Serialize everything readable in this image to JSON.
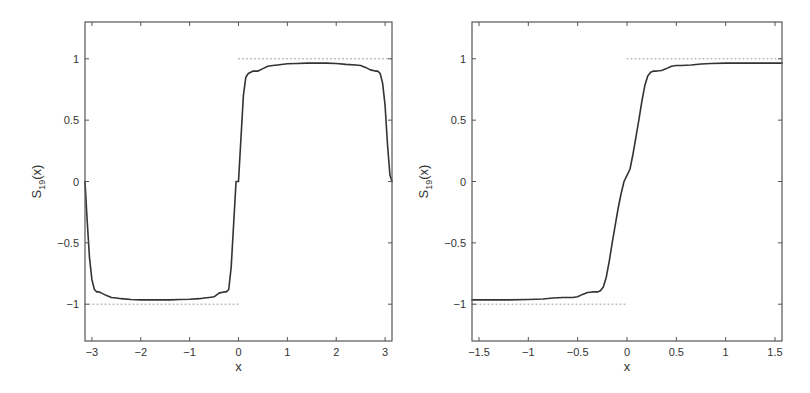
{
  "chart_data": [
    {
      "type": "line",
      "title": "",
      "xlabel": "x",
      "ylabel": "S_19(x)",
      "ylabel_main": "S",
      "ylabel_sub": "19",
      "ylabel_tail": "(x)",
      "xlim": [
        -3.1416,
        3.1416
      ],
      "ylim": [
        -1.3,
        1.3
      ],
      "grid": false,
      "legend": null,
      "xticks": [
        -3,
        -2,
        -1,
        0,
        1,
        2,
        3
      ],
      "xtick_labels": [
        "−3",
        "−2",
        "−1",
        "0",
        "1",
        "2",
        "3"
      ],
      "yticks": [
        1,
        0.5,
        0,
        -0.5,
        -1
      ],
      "ytick_labels": [
        "1",
        "0.5",
        "0",
        "−0.5",
        "−1"
      ],
      "series": [
        {
          "name": "S_19(x)",
          "style": "solid",
          "color": "#333333",
          "x": [
            -3.1416,
            -3.1,
            -3.05,
            -3.0,
            -2.95,
            -2.9,
            -2.85,
            -2.8,
            -2.7,
            -2.6,
            -2.5,
            -2.4,
            -2.2,
            -2.0,
            -1.8,
            -1.6,
            -1.4,
            -1.2,
            -1.0,
            -0.8,
            -0.7,
            -0.6,
            -0.5,
            -0.4,
            -0.3,
            -0.25,
            -0.2,
            -0.15,
            -0.1,
            -0.05,
            0.0,
            0.05,
            0.1,
            0.15,
            0.2,
            0.25,
            0.3,
            0.4,
            0.5,
            0.6,
            0.7,
            0.8,
            1.0,
            1.2,
            1.4,
            1.6,
            1.8,
            2.0,
            2.2,
            2.4,
            2.5,
            2.6,
            2.7,
            2.8,
            2.85,
            2.9,
            2.95,
            3.0,
            3.05,
            3.1,
            3.1416
          ],
          "y": [
            0.0,
            -0.3,
            -0.62,
            -0.8,
            -0.88,
            -0.9,
            -0.9,
            -0.91,
            -0.93,
            -0.945,
            -0.95,
            -0.955,
            -0.962,
            -0.965,
            -0.965,
            -0.965,
            -0.965,
            -0.962,
            -0.96,
            -0.955,
            -0.95,
            -0.945,
            -0.94,
            -0.91,
            -0.9,
            -0.9,
            -0.88,
            -0.7,
            -0.35,
            0.0,
            0.0,
            0.35,
            0.7,
            0.85,
            0.88,
            0.89,
            0.9,
            0.9,
            0.92,
            0.94,
            0.945,
            0.95,
            0.96,
            0.962,
            0.965,
            0.965,
            0.965,
            0.962,
            0.955,
            0.95,
            0.945,
            0.93,
            0.91,
            0.9,
            0.9,
            0.88,
            0.8,
            0.62,
            0.3,
            0.05,
            0.0
          ]
        },
        {
          "name": "target-level-low",
          "style": "dotted",
          "color": "#888888",
          "x": [
            -3.1416,
            0
          ],
          "y": [
            -1,
            -1
          ]
        },
        {
          "name": "target-level-high",
          "style": "dotted",
          "color": "#888888",
          "x": [
            0,
            3.1416
          ],
          "y": [
            1,
            1
          ]
        }
      ]
    },
    {
      "type": "line",
      "title": "",
      "xlabel": "x",
      "ylabel": "S_19(x)",
      "ylabel_main": "S",
      "ylabel_sub": "19",
      "ylabel_tail": "(x)",
      "xlim": [
        -1.5708,
        1.5708
      ],
      "ylim": [
        -1.3,
        1.3
      ],
      "grid": false,
      "legend": null,
      "xticks": [
        -1.5,
        -1,
        -0.5,
        0,
        0.5,
        1,
        1.5
      ],
      "xtick_labels": [
        "−1.5",
        "−1",
        "−0.5",
        "0",
        "0.5",
        "1",
        "1.5"
      ],
      "yticks": [
        1,
        0.5,
        0,
        -0.5,
        -1
      ],
      "ytick_labels": [
        "1",
        "0.5",
        "0",
        "−0.5",
        "−1"
      ],
      "series": [
        {
          "name": "S_19(x)",
          "style": "solid",
          "color": "#333333",
          "x": [
            -1.5708,
            -1.4,
            -1.2,
            -1.0,
            -0.85,
            -0.75,
            -0.65,
            -0.55,
            -0.5,
            -0.45,
            -0.4,
            -0.35,
            -0.3,
            -0.27,
            -0.24,
            -0.21,
            -0.18,
            -0.15,
            -0.12,
            -0.09,
            -0.06,
            -0.03,
            0.0,
            0.03,
            0.06,
            0.09,
            0.12,
            0.15,
            0.18,
            0.21,
            0.24,
            0.27,
            0.3,
            0.35,
            0.4,
            0.45,
            0.5,
            0.55,
            0.65,
            0.75,
            0.85,
            1.0,
            1.2,
            1.4,
            1.5708
          ],
          "y": [
            -0.965,
            -0.965,
            -0.965,
            -0.962,
            -0.958,
            -0.95,
            -0.945,
            -0.945,
            -0.94,
            -0.92,
            -0.905,
            -0.9,
            -0.9,
            -0.89,
            -0.86,
            -0.78,
            -0.65,
            -0.5,
            -0.36,
            -0.22,
            -0.1,
            0.0,
            0.05,
            0.1,
            0.22,
            0.36,
            0.5,
            0.65,
            0.78,
            0.86,
            0.89,
            0.9,
            0.9,
            0.905,
            0.92,
            0.94,
            0.945,
            0.945,
            0.95,
            0.958,
            0.962,
            0.965,
            0.965,
            0.965,
            0.965
          ]
        },
        {
          "name": "target-level-low",
          "style": "dotted",
          "color": "#888888",
          "x": [
            -1.5708,
            0
          ],
          "y": [
            -1,
            -1
          ]
        },
        {
          "name": "target-level-high",
          "style": "dotted",
          "color": "#888888",
          "x": [
            0,
            1.5708
          ],
          "y": [
            1,
            1
          ]
        }
      ]
    }
  ],
  "layout": {
    "plots": [
      {
        "left": 85,
        "top": 22,
        "right": 392,
        "bottom": 341
      },
      {
        "left": 472,
        "top": 22,
        "right": 782,
        "bottom": 341
      }
    ],
    "axis_color": "#555555",
    "curve_color": "#333333",
    "dotted_color": "#999999"
  }
}
